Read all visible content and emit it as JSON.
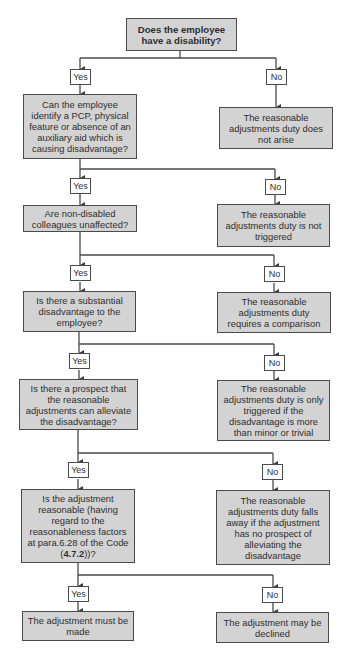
{
  "flowchart": {
    "root": {
      "text": "Does the employee have a disability?"
    },
    "labels": {
      "yes": "Yes",
      "no": "No"
    },
    "steps": [
      {
        "question": "Can the employee identify a PCP, physical feature or absence of an auxiliary aid which is causing disadvantage?",
        "no_outcome": "The reasonable adjustments duty does not arise"
      },
      {
        "question": "Are non-disabled colleagues unaffected?",
        "no_outcome": "The reasonable adjustments duty is not triggered"
      },
      {
        "question": "Is there a substantial disadvantage to the employee?",
        "no_outcome": "The reasonable adjustments duty requires a comparison"
      },
      {
        "question": "Is there a prospect that the reasonable adjustments can alleviate the disadvantage?",
        "no_outcome": "The reasonable adjustments duty is only triggered if the disadvantage is more than minor or trivial"
      },
      {
        "question_prefix": "Is the adjustment reasonable (having regard to the reasonableness factors at para.6.28 of the Code (",
        "question_ref": "4.7.2",
        "question_suffix": "))?",
        "no_outcome": "The reasonable adjustments duty falls away if the adjustment has no prospect of alleviating the disadvantage"
      }
    ],
    "final": {
      "yes_outcome": "The adjustment must be made",
      "no_outcome": "The adjustment may be declined"
    }
  },
  "colors": {
    "box_fill": "#d3d3d3",
    "border": "#4a4a4a",
    "label_fill": "#ffffff"
  }
}
